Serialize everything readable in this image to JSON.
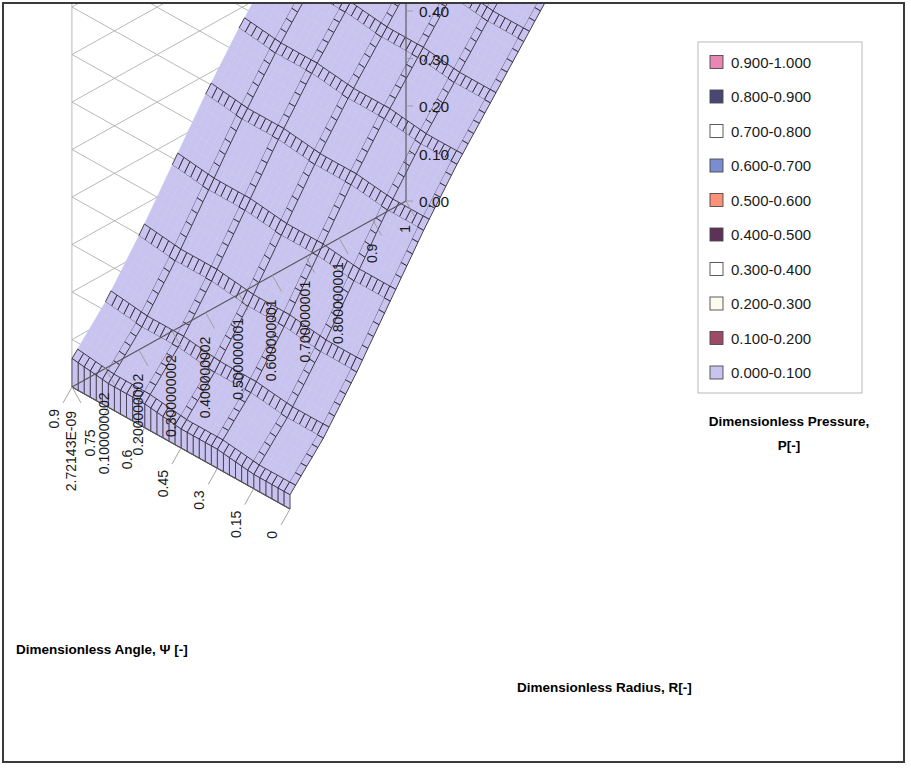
{
  "chart_data": {
    "type": "surface",
    "title": "",
    "xlabel": "Dimensionless Angle,  Ψ [-]",
    "ylabel": "Dimensionless Radius, R[-]",
    "zlabel_line1": "Dimensionless Pressure,",
    "zlabel_line2": "P[-]",
    "zlim": [
      0,
      1
    ],
    "z_ticks": [
      "0.00",
      "0.10",
      "0.20",
      "0.30",
      "0.40",
      "0.50",
      "0.60",
      "0.70",
      "0.80",
      "0.90",
      "1.00"
    ],
    "x_ticks": [
      "0",
      "0.15",
      "0.3",
      "0.45",
      "0.6",
      "0.75",
      "0.9"
    ],
    "y_ticks": [
      "2.72143E-09",
      "0.100000002",
      "0.200000002",
      "0.300000002",
      "0.400000002",
      "0.500000001",
      "0.600000001",
      "0.700000001",
      "0.800000001",
      "0.9",
      "1"
    ],
    "x_values": [
      0,
      0.15,
      0.3,
      0.45,
      0.6,
      0.75,
      0.9
    ],
    "y_values": [
      0,
      0.1,
      0.2,
      0.3,
      0.4,
      0.5,
      0.6,
      0.7,
      0.8,
      0.9,
      1.0
    ],
    "grid": true,
    "legend_position": "right",
    "bands": [
      {
        "label": "0.900-1.000",
        "color": "#e887b4",
        "min": 0.9,
        "max": 1.0
      },
      {
        "label": "0.800-0.900",
        "color": "#4a4573",
        "min": 0.8,
        "max": 0.9
      },
      {
        "label": "0.700-0.800",
        "color": "#ffffff",
        "min": 0.7,
        "max": 0.8
      },
      {
        "label": "0.600-0.700",
        "color": "#7b8dd0",
        "min": 0.6,
        "max": 0.7
      },
      {
        "label": "0.500-0.600",
        "color": "#fa9279",
        "min": 0.5,
        "max": 0.6
      },
      {
        "label": "0.400-0.500",
        "color": "#5e3158",
        "min": 0.4,
        "max": 0.5
      },
      {
        "label": "0.300-0.400",
        "color": "#ffffff",
        "min": 0.3,
        "max": 0.4
      },
      {
        "label": "0.200-0.300",
        "color": "#fbfbee",
        "min": 0.2,
        "max": 0.3
      },
      {
        "label": "0.100-0.200",
        "color": "#9d4a67",
        "min": 0.1,
        "max": 0.2
      },
      {
        "label": "0.000-0.100",
        "color": "#c9c3ef",
        "min": 0.0,
        "max": 0.1
      }
    ],
    "surface_note": "P rises from ~0 at R=0 to ~1.0 plateau at large R; monotonic in R, nearly flat in Psi",
    "z_matrix_rows_are_psi": [
      [
        0.03,
        0.11,
        0.21,
        0.32,
        0.43,
        0.53,
        0.62,
        0.71,
        0.8,
        0.9,
        1.0
      ],
      [
        0.03,
        0.11,
        0.21,
        0.32,
        0.43,
        0.53,
        0.62,
        0.71,
        0.8,
        0.9,
        1.0
      ],
      [
        0.04,
        0.12,
        0.22,
        0.33,
        0.44,
        0.54,
        0.63,
        0.72,
        0.81,
        0.9,
        1.0
      ],
      [
        0.04,
        0.12,
        0.22,
        0.33,
        0.44,
        0.54,
        0.63,
        0.72,
        0.81,
        0.9,
        1.0
      ],
      [
        0.05,
        0.13,
        0.23,
        0.34,
        0.45,
        0.55,
        0.64,
        0.73,
        0.82,
        0.91,
        1.0
      ],
      [
        0.05,
        0.13,
        0.23,
        0.34,
        0.45,
        0.55,
        0.64,
        0.73,
        0.82,
        0.91,
        1.0
      ],
      [
        0.06,
        0.14,
        0.24,
        0.35,
        0.46,
        0.56,
        0.65,
        0.74,
        0.83,
        0.91,
        1.0
      ]
    ]
  },
  "legend": {
    "items": [
      "0.900-1.000",
      "0.800-0.900",
      "0.700-0.800",
      "0.600-0.700",
      "0.500-0.600",
      "0.400-0.500",
      "0.300-0.400",
      "0.200-0.300",
      "0.100-0.200",
      "0.000-0.100"
    ]
  }
}
